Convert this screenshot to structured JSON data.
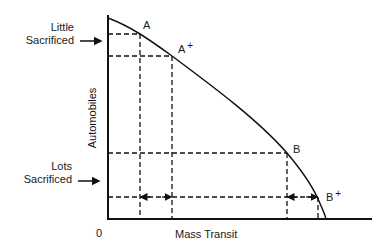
{
  "diagram": {
    "type": "production-possibilities-frontier",
    "x_axis": {
      "label": "Mass Transit",
      "origin": "0"
    },
    "y_axis": {
      "label": "Automobiles"
    },
    "side_labels": [
      {
        "line1": "Little",
        "line2": "Sacrificed"
      },
      {
        "line1": "Lots",
        "line2": "Sacrificed"
      }
    ],
    "points": [
      {
        "name": "A",
        "sup": ""
      },
      {
        "name": "A",
        "sup": "+"
      },
      {
        "name": "B",
        "sup": ""
      },
      {
        "name": "B",
        "sup": "+"
      }
    ],
    "colors": {
      "line": "#111111",
      "background": "#ffffff"
    }
  }
}
